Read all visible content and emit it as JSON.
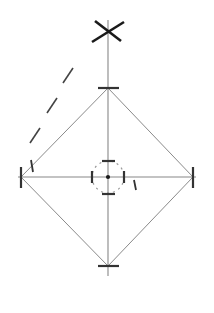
{
  "document": {
    "title": "Geometric Construction Drawing",
    "background_color": "#ffffff",
    "width": 214,
    "height": 313
  },
  "style": {
    "axis_color": "#888888",
    "edge_color": "#8a8a8a",
    "tick_color": "#333333",
    "dashed_color": "#444444",
    "circle_color": "#999999",
    "mark_color": "#1a1a1a",
    "axis_width": 1.1,
    "edge_width": 1.0,
    "tick_width": 2.2,
    "dashed_width": 1.6,
    "circle_width": 1.2,
    "mark_width": 2.6
  },
  "geometry": {
    "center": {
      "x": 108,
      "y": 177
    },
    "vertical_axis": {
      "x": 108,
      "y_top": 20,
      "y_bottom": 276
    },
    "horizontal_axis": {
      "y": 177,
      "x_left": 18,
      "x_right": 196
    },
    "diamond_vertices": {
      "top": {
        "x": 108,
        "y": 88
      },
      "right": {
        "x": 193,
        "y": 177
      },
      "bottom": {
        "x": 108,
        "y": 266
      },
      "left": {
        "x": 21,
        "y": 177
      }
    },
    "center_circle": {
      "cx": 108,
      "cy": 177,
      "r": 16,
      "dash": "2 4"
    },
    "construction_dashes": [
      {
        "x1": 30,
        "y1": 143,
        "x2": 40,
        "y2": 128
      },
      {
        "x1": 47,
        "y1": 113,
        "x2": 57,
        "y2": 98
      },
      {
        "x1": 63,
        "y1": 83,
        "x2": 73,
        "y2": 68
      }
    ],
    "cross_mark": {
      "cx": 108,
      "cy": 31,
      "arm1": {
        "x1": 92,
        "y1": 42,
        "x2": 124,
        "y2": 22
      },
      "arm2": {
        "x1": 95,
        "y1": 21,
        "x2": 121,
        "y2": 41
      }
    },
    "vertex_ticks": [
      {
        "name": "top-vertex-tick",
        "x1": 98,
        "y1": 88,
        "x2": 119,
        "y2": 88
      },
      {
        "name": "bottom-vertex-tick",
        "x1": 98,
        "y1": 266,
        "x2": 119,
        "y2": 266
      },
      {
        "name": "left-vertex-tick",
        "x1": 21,
        "y1": 167,
        "x2": 21,
        "y2": 188
      },
      {
        "name": "right-vertex-tick",
        "x1": 193,
        "y1": 167,
        "x2": 193,
        "y2": 188
      }
    ],
    "center_ticks": [
      {
        "name": "center-tick-left",
        "x1": 92,
        "y1": 171,
        "x2": 92,
        "y2": 183
      },
      {
        "name": "center-tick-right",
        "x1": 124,
        "y1": 171,
        "x2": 124,
        "y2": 183
      },
      {
        "name": "center-tick-up",
        "x1": 102,
        "y1": 161,
        "x2": 115,
        "y2": 161
      },
      {
        "name": "center-tick-down",
        "x1": 102,
        "y1": 194,
        "x2": 115,
        "y2": 194
      }
    ],
    "center_dot": {
      "cx": 108,
      "cy": 177,
      "r": 2.1
    },
    "small_marks": [
      {
        "name": "small-mark-left-vertex",
        "x1": 31,
        "y1": 160,
        "x2": 33,
        "y2": 172
      },
      {
        "name": "small-mark-right-center",
        "x1": 134,
        "y1": 180,
        "x2": 136,
        "y2": 190
      }
    ]
  }
}
